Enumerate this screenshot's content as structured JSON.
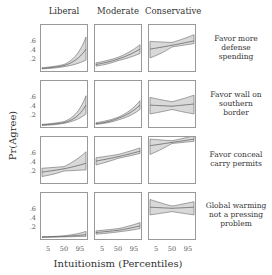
{
  "chart_data": {
    "type": "line",
    "title": "",
    "xlabel": "Intuitionism (Percentiles)",
    "ylabel": "Pr(Agree)",
    "x_ticks": [
      "5",
      "50",
      "95"
    ],
    "y_ticks": [
      ".2",
      ".4",
      ".6"
    ],
    "ylim": [
      0,
      0.8
    ],
    "columns": [
      "Liberal",
      "Moderate",
      "Conservative"
    ],
    "rows": [
      "Favor more defense spending",
      "Favor wall on southern border",
      "Favor conceal carry permits",
      "Global warming not a pressing problem"
    ],
    "x": [
      5,
      50,
      95
    ],
    "panels": [
      {
        "row": "Favor more defense spending",
        "column": "Liberal",
        "mean": [
          0.03,
          0.08,
          0.38
        ],
        "lower": [
          0.02,
          0.06,
          0.18
        ],
        "upper": [
          0.04,
          0.1,
          0.6
        ]
      },
      {
        "row": "Favor more defense spending",
        "column": "Moderate",
        "mean": [
          0.1,
          0.2,
          0.38
        ],
        "lower": [
          0.07,
          0.17,
          0.3
        ],
        "upper": [
          0.13,
          0.23,
          0.46
        ]
      },
      {
        "row": "Favor more defense spending",
        "column": "Conservative",
        "mean": [
          0.38,
          0.45,
          0.53
        ],
        "lower": [
          0.22,
          0.42,
          0.48
        ],
        "upper": [
          0.52,
          0.5,
          0.64
        ]
      },
      {
        "row": "Favor wall on southern border",
        "column": "Liberal",
        "mean": [
          0.02,
          0.06,
          0.38
        ],
        "lower": [
          0.01,
          0.05,
          0.22
        ],
        "upper": [
          0.03,
          0.08,
          0.55
        ]
      },
      {
        "row": "Favor wall on southern border",
        "column": "Moderate",
        "mean": [
          0.04,
          0.14,
          0.38
        ],
        "lower": [
          0.03,
          0.11,
          0.3
        ],
        "upper": [
          0.06,
          0.16,
          0.46
        ]
      },
      {
        "row": "Favor wall on southern border",
        "column": "Conservative",
        "mean": [
          0.38,
          0.36,
          0.4
        ],
        "lower": [
          0.22,
          0.3,
          0.22
        ],
        "upper": [
          0.52,
          0.44,
          0.56
        ]
      },
      {
        "row": "Favor conceal carry permits",
        "column": "Liberal",
        "mean": [
          0.18,
          0.24,
          0.34
        ],
        "lower": [
          0.1,
          0.2,
          0.22
        ],
        "upper": [
          0.25,
          0.28,
          0.55
        ]
      },
      {
        "row": "Favor conceal carry permits",
        "column": "Moderate",
        "mean": [
          0.38,
          0.46,
          0.56
        ],
        "lower": [
          0.31,
          0.43,
          0.52
        ],
        "upper": [
          0.44,
          0.5,
          0.62
        ]
      },
      {
        "row": "Favor conceal carry permits",
        "column": "Conservative",
        "mean": [
          0.66,
          0.72,
          0.78
        ],
        "lower": [
          0.5,
          0.7,
          0.74
        ],
        "upper": [
          0.78,
          0.75,
          0.84
        ]
      },
      {
        "row": "Global warming not a pressing problem",
        "column": "Liberal",
        "mean": [
          0.02,
          0.03,
          0.06
        ],
        "lower": [
          0.01,
          0.02,
          0.03
        ],
        "upper": [
          0.02,
          0.04,
          0.12
        ]
      },
      {
        "row": "Global warming not a pressing problem",
        "column": "Moderate",
        "mean": [
          0.1,
          0.14,
          0.22
        ],
        "lower": [
          0.07,
          0.11,
          0.17
        ],
        "upper": [
          0.13,
          0.17,
          0.28
        ]
      },
      {
        "row": "Global warming not a pressing problem",
        "column": "Conservative",
        "mean": [
          0.56,
          0.54,
          0.56
        ],
        "lower": [
          0.42,
          0.48,
          0.42
        ],
        "upper": [
          0.7,
          0.58,
          0.66
        ]
      }
    ],
    "colors": {
      "band": "#d9d9d9",
      "line": "#666666",
      "frame": "#999999"
    }
  },
  "labels": {
    "col_liberal": "Liberal",
    "col_moderate": "Moderate",
    "col_conservative": "Conservative",
    "row_1_l1": "Favor more",
    "row_1_l2": "defense",
    "row_1_l3": "spending",
    "row_2_l1": "Favor wall on",
    "row_2_l2": "southern",
    "row_2_l3": "border",
    "row_3_l1": "Favor conceal",
    "row_3_l2": "carry permits",
    "row_4_l1": "Global warming",
    "row_4_l2": "not a pressing",
    "row_4_l3": "problem",
    "ylabel": "Pr(Agree)",
    "xlabel": "Intuitionism (Percentiles)",
    "ytick_6": ".6",
    "ytick_4": ".4",
    "ytick_2": ".2",
    "xtick_5": "5",
    "xtick_50": "50",
    "xtick_95": "95"
  }
}
